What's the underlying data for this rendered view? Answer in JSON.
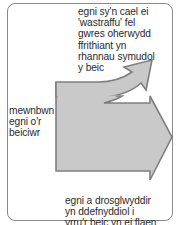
{
  "diagram": {
    "type": "energy-transfer-arrow",
    "labels": {
      "wasted_energy": "egni sy'n cael ei\n'wastraffu' fel\ngwres oherwydd\nffrithiant yn\nrhannau symudol\ny beic",
      "input_energy": "mewnbwn\negni o'r\nbeiciwr",
      "useful_energy": "egni a drosglwyddir\nyn ddefnyddiol i\nyrru'r beic yn ei flaen"
    },
    "colors": {
      "arrow_fill": "#c9c9c9",
      "arrow_stroke": "#7f7f7f",
      "frame_stroke": "#8a8a8a",
      "text": "#2a2a2a"
    }
  }
}
